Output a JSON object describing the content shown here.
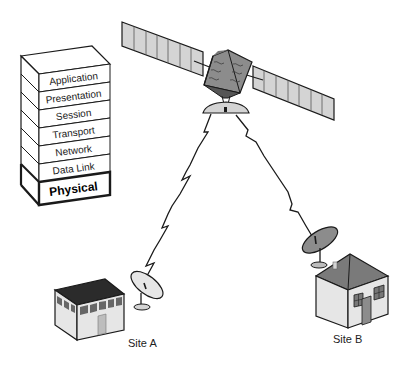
{
  "diagram": {
    "osi_stack": {
      "layers": [
        {
          "label": "Application"
        },
        {
          "label": "Presentation"
        },
        {
          "label": "Session"
        },
        {
          "label": "Transport"
        },
        {
          "label": "Network"
        },
        {
          "label": "Data Link"
        },
        {
          "label": "Physical",
          "highlighted": true
        }
      ]
    },
    "satellite": {
      "name": "satellite"
    },
    "sites": [
      {
        "label": "Site A",
        "type": "office-building"
      },
      {
        "label": "Site B",
        "type": "house"
      }
    ],
    "links": [
      {
        "from": "satellite",
        "to": "Site A"
      },
      {
        "from": "satellite",
        "to": "Site B"
      }
    ],
    "colors": {
      "outline": "#1a1a1a",
      "panel_fill": "#d4d4d4",
      "body_fill": "#8c8c8c",
      "roof_dark": "#2b2b2b",
      "roof_gray": "#7a7a7a",
      "wall_light": "#e6e6e6",
      "wall_mid": "#c8c8c8"
    }
  }
}
